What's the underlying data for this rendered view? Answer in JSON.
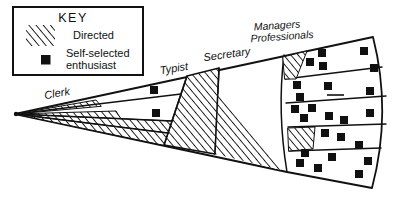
{
  "figure": {
    "type": "fan-diagram",
    "background": "#ffffff",
    "ink": "#111111",
    "labels": {
      "clerk": "Clerk",
      "typist": "Typist",
      "secretary": "Secretary",
      "managers_line1": "Managers",
      "managers_line2": "Professionals"
    },
    "key": {
      "title": "KEY",
      "items": [
        {
          "swatch": "hatched",
          "label": "Directed"
        },
        {
          "swatch": "black-square",
          "label_line1": "Self-selected",
          "label_line2": "enthusiast"
        }
      ]
    },
    "regions": [
      {
        "label": "Clerk",
        "hatched": "partial"
      },
      {
        "label": "Typist",
        "hatched": "full"
      },
      {
        "label": "Secretary",
        "hatched": "lower-part"
      },
      {
        "label": "Managers Professionals",
        "hatched": "small-strips-rows-1-and-4"
      }
    ],
    "square_size": 8,
    "enthusiast_squares": {
      "clerk": [
        [
          154,
          90
        ],
        [
          156,
          113
        ]
      ],
      "managers_band1": [
        [
          310,
          62
        ],
        [
          322,
          53
        ],
        [
          323,
          66
        ],
        [
          364,
          51
        ],
        [
          374,
          68
        ]
      ],
      "managers_band2": [
        [
          297,
          85
        ],
        [
          328,
          86
        ],
        [
          370,
          91
        ],
        [
          300,
          97
        ]
      ],
      "managers_band3": [
        [
          295,
          109
        ],
        [
          312,
          108
        ],
        [
          304,
          118
        ],
        [
          329,
          116
        ],
        [
          344,
          120
        ],
        [
          370,
          113
        ]
      ],
      "managers_band4": [
        [
          325,
          133
        ],
        [
          341,
          137
        ],
        [
          359,
          145
        ]
      ],
      "managers_band5": [
        [
          305,
          153
        ],
        [
          332,
          157
        ],
        [
          300,
          163
        ],
        [
          318,
          168
        ],
        [
          368,
          161
        ],
        [
          359,
          174
        ]
      ]
    },
    "dash_mark": {
      "x1": 327,
      "y1": 95,
      "x2": 344,
      "y2": 95
    }
  }
}
